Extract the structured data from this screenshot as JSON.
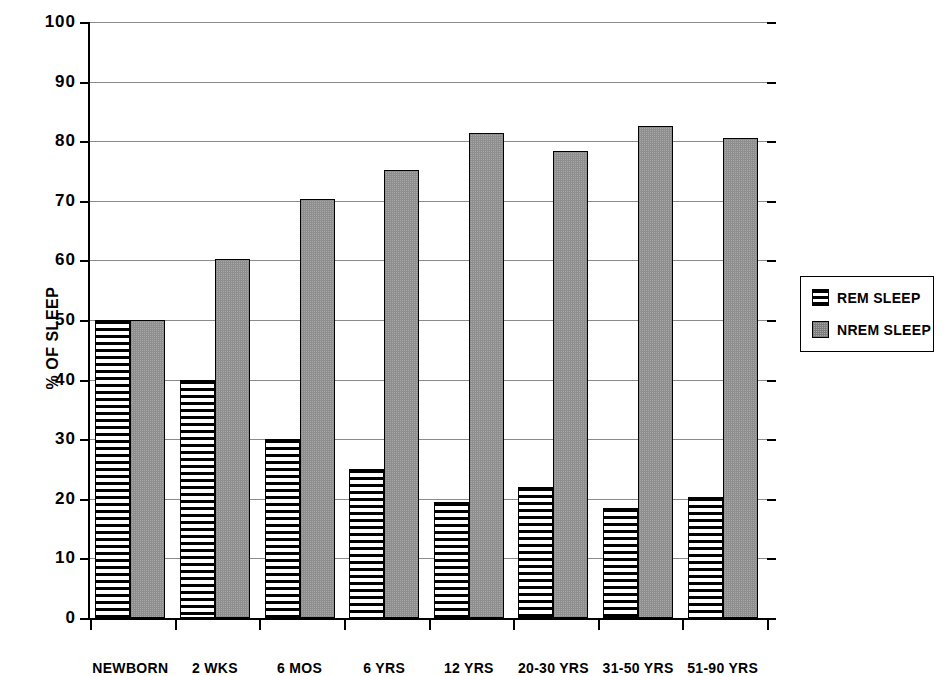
{
  "chart_data": {
    "type": "bar",
    "title": "",
    "xlabel": "",
    "ylabel": "% OF SLEEP",
    "ylim": [
      0,
      100
    ],
    "yticks": [
      0,
      10,
      20,
      30,
      40,
      50,
      60,
      70,
      80,
      90,
      100
    ],
    "grid": true,
    "legend_position": "right",
    "categories": [
      "NEWBORN",
      "2 WKS",
      "6 MOS",
      "6 YRS",
      "12 YRS",
      "20-30 YRS",
      "31-50 YRS",
      "51-90 YRS"
    ],
    "series": [
      {
        "name": "REM SLEEP",
        "pattern": "horizontal-stripes",
        "color": "#000000",
        "values": [
          50,
          40,
          30,
          25,
          19.5,
          22,
          18.5,
          20.3
        ]
      },
      {
        "name": "NREM SLEEP",
        "pattern": "gray-stipple",
        "color": "#a8a8a8",
        "values": [
          50,
          60.2,
          70.3,
          75.2,
          81.4,
          78.4,
          82.5,
          80.5
        ]
      }
    ]
  },
  "axis": {
    "y_title": "% OF SLEEP",
    "y_tick_labels": [
      "0",
      "10",
      "20",
      "30",
      "40",
      "50",
      "60",
      "70",
      "80",
      "90",
      "100"
    ]
  },
  "legend": {
    "items": [
      {
        "label": "REM SLEEP",
        "swatch": "rem-swatch-icon"
      },
      {
        "label": "NREM SLEEP",
        "swatch": "nrem-swatch-icon"
      }
    ]
  }
}
